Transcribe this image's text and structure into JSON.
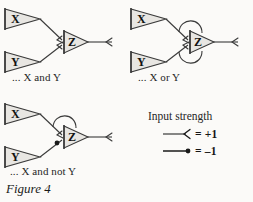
{
  "figure": {
    "label": "Figure 4",
    "colors": {
      "background": "#fbfaf8",
      "node_fill": "#e8e6e2",
      "stroke": "#3a3a3a",
      "text": "#1a1a1a"
    }
  },
  "panels": [
    {
      "id": "and",
      "caption": "... X and Y",
      "nodes": [
        {
          "id": "x",
          "label": "X"
        },
        {
          "id": "y",
          "label": "Y"
        },
        {
          "id": "z",
          "label": "Z"
        }
      ],
      "connections": [
        {
          "from": "X",
          "to": "Z",
          "type": "excitatory",
          "strength": "+1",
          "marker": "open-arrowhead"
        },
        {
          "from": "Y",
          "to": "Z",
          "type": "excitatory",
          "strength": "+1",
          "marker": "open-arrowhead"
        }
      ],
      "output": {
        "from": "Z",
        "type": "excitatory",
        "marker": "open-arrowhead"
      }
    },
    {
      "id": "or",
      "caption": "... X or Y",
      "nodes": [
        {
          "id": "x",
          "label": "X"
        },
        {
          "id": "y",
          "label": "Y"
        },
        {
          "id": "z",
          "label": "Z"
        }
      ],
      "connections": [
        {
          "from": "X",
          "to": "Z",
          "type": "excitatory",
          "strength": "+1",
          "marker": "open-arrowhead",
          "looped": true
        },
        {
          "from": "Y",
          "to": "Z",
          "type": "excitatory",
          "strength": "+1",
          "marker": "open-arrowhead",
          "looped": true
        }
      ],
      "output": {
        "from": "Z",
        "type": "excitatory",
        "marker": "open-arrowhead"
      }
    },
    {
      "id": "and-not",
      "caption": "... X and not Y",
      "nodes": [
        {
          "id": "x",
          "label": "X"
        },
        {
          "id": "y",
          "label": "Y"
        },
        {
          "id": "z",
          "label": "Z"
        }
      ],
      "connections": [
        {
          "from": "X",
          "to": "Z",
          "type": "excitatory",
          "strength": "+1",
          "marker": "open-arrowhead",
          "looped": true
        },
        {
          "from": "Y",
          "to": "Z",
          "type": "inhibitory",
          "strength": "-1",
          "marker": "filled-dot"
        }
      ],
      "output": {
        "from": "Z",
        "type": "excitatory",
        "marker": "open-arrowhead"
      }
    }
  ],
  "legend": {
    "title": "Input strength",
    "rows": [
      {
        "symbol": "open-arrowhead",
        "value": "= +1"
      },
      {
        "symbol": "filled-dot",
        "value": "= –1"
      }
    ]
  }
}
